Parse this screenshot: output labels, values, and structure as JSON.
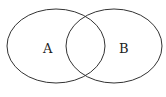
{
  "diagram": {
    "type": "venn",
    "sets": [
      {
        "id": "A",
        "label": "A"
      },
      {
        "id": "B",
        "label": "B"
      }
    ],
    "stroke_color": "#333333",
    "fill_color": "#ffffff"
  }
}
